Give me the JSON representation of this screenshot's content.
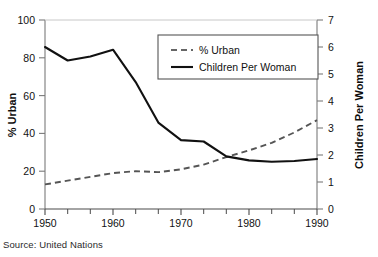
{
  "source_note": "Source: United Nations",
  "chart_data": {
    "type": "line",
    "title": "Urban Rate",
    "title_visible": false,
    "xlabel": "",
    "ylabel": "% Urban",
    "y2label": "Children Per Woman",
    "x": [
      1950,
      1955,
      1960,
      1965,
      1970,
      1975,
      1980,
      1985,
      1990,
      1995,
      2000,
      2005,
      2010
    ],
    "xlim": [
      1950,
      2010
    ],
    "xticks": [
      1950,
      1960,
      1970,
      1980,
      1990,
      2000,
      2010
    ],
    "xtick_labels": [
      "1950",
      "1960",
      "1970",
      "1980",
      "1990",
      "2000",
      "2010"
    ],
    "xminor_step": 5,
    "ylim": [
      0,
      100
    ],
    "yticks": [
      0,
      20,
      40,
      60,
      80,
      100
    ],
    "ytick_labels": [
      "0",
      "20",
      "40",
      "60",
      "80",
      "100"
    ],
    "y2lim": [
      0,
      7
    ],
    "y2ticks": [
      0,
      1,
      2,
      3,
      4,
      5,
      6,
      7
    ],
    "y2tick_labels": [
      "0",
      "1",
      "2",
      "3",
      "4",
      "5",
      "6",
      "7"
    ],
    "grid": false,
    "legend_position": "upper center",
    "series": [
      {
        "name": "% Urban",
        "axis": "left",
        "style": "dashed",
        "color": "#555555",
        "values": [
          13,
          15,
          17,
          19,
          20,
          19.5,
          21,
          23.5,
          27.5,
          31,
          35,
          40.5,
          47
        ]
      },
      {
        "name": "Children Per Woman",
        "axis": "right",
        "style": "solid",
        "color": "#111111",
        "values": [
          6.0,
          5.5,
          5.65,
          5.9,
          4.7,
          3.2,
          2.55,
          2.5,
          1.95,
          1.8,
          1.75,
          1.78,
          1.85
        ]
      }
    ]
  },
  "legend": {
    "items": [
      {
        "label": "% Urban",
        "style": "dashed"
      },
      {
        "label": "Children Per Woman",
        "style": "solid"
      }
    ]
  }
}
